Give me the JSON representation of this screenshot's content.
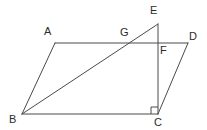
{
  "figure": {
    "stroke_color": "#4a4a4a",
    "label_color": "#2b2b2b",
    "background_color": "#ffffff",
    "stroke_width": 1,
    "points": {
      "A": {
        "label": "A",
        "x": 55,
        "y": 43,
        "label_x": 44,
        "label_y": 26
      },
      "B": {
        "label": "B",
        "x": 22,
        "y": 114,
        "label_x": 9,
        "label_y": 114
      },
      "C": {
        "label": "C",
        "x": 158,
        "y": 114,
        "label_x": 154,
        "label_y": 117
      },
      "D": {
        "label": "D",
        "x": 188,
        "y": 43,
        "label_x": 189,
        "label_y": 31
      },
      "E": {
        "label": "E",
        "x": 158,
        "y": 24,
        "label_x": 150,
        "label_y": 5
      },
      "F": {
        "label": "F",
        "x": 158,
        "y": 43,
        "label_x": 160,
        "label_y": 45
      },
      "G": {
        "label": "G",
        "x": 128,
        "y": 43,
        "label_x": 120,
        "label_y": 27
      }
    },
    "segments": [
      {
        "name": "segment-AD",
        "from": "A",
        "to": "D"
      },
      {
        "name": "segment-AB",
        "from": "A",
        "to": "B"
      },
      {
        "name": "segment-BC",
        "from": "B",
        "to": "C"
      },
      {
        "name": "segment-CD",
        "from": "C",
        "to": "D"
      },
      {
        "name": "segment-BE",
        "from": "B",
        "to": "E"
      },
      {
        "name": "segment-EC",
        "from": "E",
        "to": "C"
      }
    ],
    "right_angle": {
      "name": "right-angle-marker-at-C",
      "at": "C",
      "size": 7,
      "direction": "up-left"
    }
  }
}
